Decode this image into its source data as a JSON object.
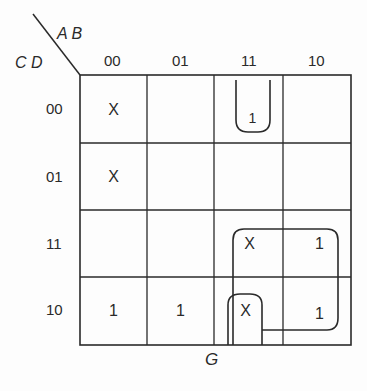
{
  "kmap": {
    "row_var": "C D",
    "col_var": "A B",
    "col_labels": [
      "00",
      "01",
      "11",
      "10"
    ],
    "row_labels": [
      "00",
      "01",
      "11",
      "10"
    ],
    "cells": [
      [
        "X",
        "",
        "1",
        ""
      ],
      [
        "X",
        "",
        "",
        ""
      ],
      [
        "",
        "",
        "X",
        "1"
      ],
      [
        "1",
        "1",
        "X",
        "1"
      ]
    ],
    "output_label": "G",
    "groupings": [
      {
        "name": "pair-AB11-CD00",
        "cells": [
          [
            0,
            2
          ]
        ],
        "shape": "open-bottom loop"
      },
      {
        "name": "quad-AB11-10-CD11-10",
        "cells": [
          [
            2,
            2
          ],
          [
            2,
            3
          ],
          [
            3,
            2
          ],
          [
            3,
            3
          ]
        ]
      },
      {
        "name": "loop-AB11-CD10",
        "cells": [
          [
            3,
            2
          ]
        ],
        "shape": "open-bottom loop"
      }
    ]
  }
}
